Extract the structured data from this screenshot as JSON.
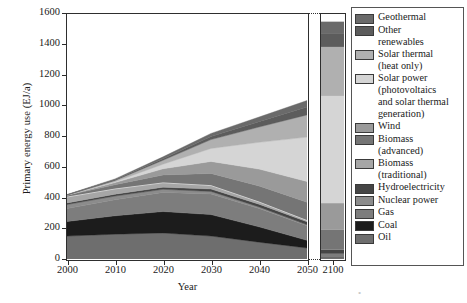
{
  "chart_data": {
    "type": "area",
    "stacking": "stacked",
    "title": "",
    "xlabel": "Year",
    "ylabel": "Primary energy use (EJ/a)",
    "xlim": [
      2000,
      2050
    ],
    "ylim": [
      0,
      1600
    ],
    "yticks": [
      0,
      200,
      400,
      600,
      800,
      1000,
      1200,
      1400,
      1600
    ],
    "xticks": [
      2000,
      2010,
      2020,
      2030,
      2040,
      2050,
      2100
    ],
    "axis_break": {
      "after": 2050,
      "before": 2100,
      "style": "dotted"
    },
    "grid": false,
    "legend_position": "right",
    "x": [
      2000,
      2010,
      2020,
      2030,
      2040,
      2050
    ],
    "x_far": [
      2100
    ],
    "series": [
      {
        "name": "Oil",
        "color": "#6e6e6e",
        "values": [
          150,
          162,
          170,
          150,
          110,
          72
        ],
        "value_2100": 8
      },
      {
        "name": "Coal",
        "color": "#1c1c1c",
        "values": [
          95,
          120,
          140,
          140,
          100,
          50
        ],
        "value_2100": 4
      },
      {
        "name": "Gas",
        "color": "#7d7d7d",
        "values": [
          85,
          105,
          125,
          135,
          120,
          95
        ],
        "value_2100": 22
      },
      {
        "name": "Nuclear power",
        "color": "#8c8c8c",
        "values": [
          26,
          24,
          20,
          16,
          10,
          6
        ],
        "value_2100": 0
      },
      {
        "name": "Hydroelectricity",
        "color": "#454545",
        "values": [
          10,
          12,
          14,
          16,
          18,
          20
        ],
        "value_2100": 26
      },
      {
        "name": "Biomass (traditional)",
        "color": "#a6a6a6",
        "values": [
          38,
          34,
          28,
          22,
          14,
          8
        ],
        "value_2100": 0
      },
      {
        "name": "Biomass (advanced)",
        "color": "#757575",
        "values": [
          12,
          28,
          52,
          80,
          105,
          120
        ],
        "value_2100": 130
      },
      {
        "name": "Wind",
        "color": "#9a9a9a",
        "values": [
          1,
          14,
          40,
          78,
          110,
          135
        ],
        "value_2100": 175
      },
      {
        "name": "Solar power (photovoltaics and solar thermal generation)",
        "color": "#d5d5d5",
        "values": [
          0,
          6,
          30,
          85,
          175,
          290
        ],
        "value_2100": 700
      },
      {
        "name": "Solar thermal (heat only)",
        "color": "#b0b0b0",
        "values": [
          1,
          8,
          26,
          58,
          100,
          145
        ],
        "value_2100": 320
      },
      {
        "name": "Other renewables",
        "color": "#5c5c5c",
        "values": [
          1,
          4,
          10,
          20,
          35,
          52
        ],
        "value_2100": 90
      },
      {
        "name": "Geothermal",
        "color": "#6a6a6a",
        "values": [
          2,
          6,
          12,
          20,
          30,
          42
        ],
        "value_2100": 75
      }
    ],
    "totals": [
      421,
      523,
      667,
      820,
      927,
      1035
    ],
    "total_2100": 1550
  },
  "axis": {
    "ylabel": "Primary energy use (EJ/a)",
    "xlabel": "Year",
    "yticks": [
      "1600",
      "1400",
      "1200",
      "1000",
      "800",
      "600",
      "400",
      "200",
      "0"
    ],
    "xticks": [
      "2000",
      "2010",
      "2020",
      "2030",
      "2040",
      "2050",
      "2100"
    ]
  },
  "legend": {
    "items": [
      {
        "label": "Geothermal",
        "color": "#6a6a6a"
      },
      {
        "label": "Other\nrenewables",
        "color": "#5c5c5c"
      },
      {
        "label": "Solar thermal\n(heat only)",
        "color": "#b0b0b0"
      },
      {
        "label": "Solar power\n(photovoltaics\nand solar thermal\ngeneration)",
        "color": "#d5d5d5"
      },
      {
        "label": "Wind",
        "color": "#9a9a9a"
      },
      {
        "label": "Biomass\n(advanced)",
        "color": "#757575"
      },
      {
        "label": "Biomass\n(traditional)",
        "color": "#a6a6a6"
      },
      {
        "label": "Hydroelectricity",
        "color": "#454545"
      },
      {
        "label": "Nuclear power",
        "color": "#8c8c8c"
      },
      {
        "label": "Gas",
        "color": "#7d7d7d"
      },
      {
        "label": "Coal",
        "color": "#1c1c1c"
      },
      {
        "label": "Oil",
        "color": "#6e6e6e"
      }
    ]
  }
}
